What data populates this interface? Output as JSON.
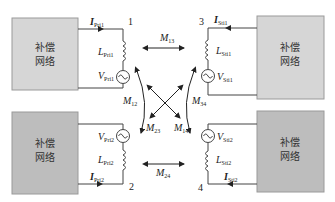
{
  "colors": {
    "box_light": "#d6d6d6",
    "box_dark": "#bdbdbd",
    "box_border": "#9a9a9a",
    "wire": "#444444",
    "text": "#222222"
  },
  "networks": [
    {
      "id": "top-left",
      "line1": "补偿",
      "line2": "网络"
    },
    {
      "id": "bottom-left",
      "line1": "补偿",
      "line2": "网络"
    },
    {
      "id": "top-right",
      "line1": "补偿",
      "line2": "网络"
    },
    {
      "id": "bottom-right",
      "line1": "补偿",
      "line2": "网络"
    }
  ],
  "coils": [
    {
      "node": "1",
      "current": "I",
      "current_sub": "Pri1",
      "inductor": "L",
      "inductor_sub": "Pri1",
      "source": "V",
      "source_sub": "Pri1"
    },
    {
      "node": "2",
      "current": "I",
      "current_sub": "Pri2",
      "inductor": "L",
      "inductor_sub": "Pri2",
      "source": "V",
      "source_sub": "Pri2"
    },
    {
      "node": "3",
      "current": "I",
      "current_sub": "Sti1",
      "inductor": "L",
      "inductor_sub": "Sti1",
      "source": "V",
      "source_sub": "Sti1"
    },
    {
      "node": "4",
      "current": "I",
      "current_sub": "Sti2",
      "inductor": "L",
      "inductor_sub": "Sti2",
      "source": "V",
      "source_sub": "Sti2"
    }
  ],
  "mutuals": {
    "m13": {
      "sym": "M",
      "sub": "13"
    },
    "m24": {
      "sym": "M",
      "sub": "24"
    },
    "m12": {
      "sym": "M",
      "sub": "12"
    },
    "m34": {
      "sym": "M",
      "sub": "34"
    },
    "m23": {
      "sym": "M",
      "sub": "23"
    },
    "m14": {
      "sym": "M",
      "sub": "14"
    }
  }
}
